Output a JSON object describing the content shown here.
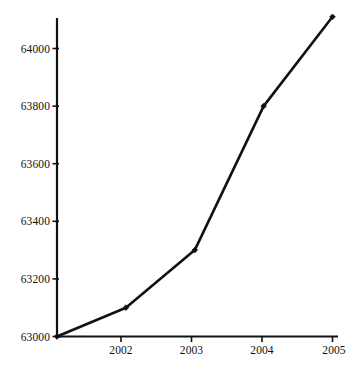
{
  "chart_data": {
    "type": "line",
    "title": "",
    "subtitle": "",
    "xlabel": "",
    "ylabel": "",
    "x": [
      2001,
      2002,
      2003,
      2004,
      2005
    ],
    "values": [
      63000,
      63100,
      63300,
      63800,
      64110
    ],
    "series": [
      {
        "name": "",
        "values": [
          63000,
          63100,
          63300,
          63800,
          64110
        ]
      }
    ],
    "x_tick_labels": [
      "2002",
      "2003",
      "2004",
      "2005"
    ],
    "x_tick_values": [
      2002,
      2003,
      2004,
      2005
    ],
    "y_tick_labels": [
      "63000",
      "63200",
      "63400",
      "63600",
      "63800",
      "64000"
    ],
    "y_tick_values": [
      63000,
      63200,
      63400,
      63600,
      63800,
      64000
    ],
    "xlim": [
      2001,
      2005.07
    ],
    "ylim": [
      63000,
      64110
    ],
    "grid": false,
    "legend": false,
    "legend_position": "none",
    "marker": "diamond",
    "line_color": "#111111",
    "marker_color": "#111111",
    "background_color": "#ffffff",
    "axis_color": "#111111"
  },
  "axes": {
    "y_ticks": [
      {
        "label": "63000",
        "value": 63000
      },
      {
        "label": "63200",
        "value": 63200
      },
      {
        "label": "63400",
        "value": 63400
      },
      {
        "label": "63600",
        "value": 63600
      },
      {
        "label": "63800",
        "value": 63800
      },
      {
        "label": "64000",
        "value": 64000
      }
    ],
    "x_ticks": [
      {
        "label": "2002",
        "value": 2002
      },
      {
        "label": "2003",
        "value": 2003
      },
      {
        "label": "2004",
        "value": 2004
      },
      {
        "label": "2005",
        "value": 2005
      }
    ]
  },
  "points": [
    {
      "x": 2001,
      "y": 63000,
      "label": "63000"
    },
    {
      "x": 2002,
      "y": 63100,
      "label": "63100"
    },
    {
      "x": 2003,
      "y": 63300,
      "label": "63300"
    },
    {
      "x": 2004,
      "y": 63800,
      "label": "63800"
    },
    {
      "x": 2005,
      "y": 64110,
      "label": "64110"
    }
  ]
}
